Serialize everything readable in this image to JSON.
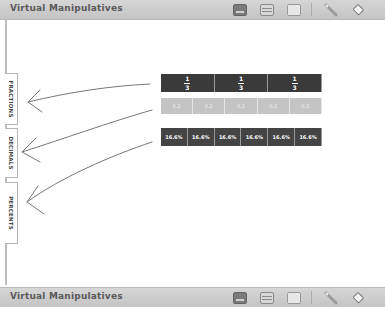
{
  "top_bar": {
    "title": "Virtual Manipulatives",
    "tools": [
      "keyboard-icon",
      "list-icon",
      "folder-icon",
      "pencil-icon",
      "eraser-icon"
    ]
  },
  "bottom_bar": {
    "title": "Virtual Manipulatives",
    "tools": [
      "keyboard-icon",
      "list-icon",
      "folder-icon",
      "pencil-icon",
      "eraser-icon"
    ]
  },
  "tabs": [
    {
      "label": "FRACTIONS"
    },
    {
      "label": "DECIMALS"
    },
    {
      "label": "PERCENTS"
    }
  ],
  "rows": {
    "fractions": [
      {
        "numerator": "1",
        "denominator": "3"
      },
      {
        "numerator": "1",
        "denominator": "3"
      },
      {
        "numerator": "1",
        "denominator": "3"
      }
    ],
    "decimals": [
      "0.2",
      "0.2",
      "0.2",
      "0.2",
      "0.2"
    ],
    "percents": [
      "16.6%",
      "16.6%",
      "16.6%",
      "16.6%",
      "16.6%",
      "16.6%"
    ]
  },
  "colors": {
    "fraction_tile": "#3a3a3a",
    "decimal_tile": "#c4c4c4",
    "percent_tile": "#444444",
    "toolbar": "#cccccc"
  }
}
